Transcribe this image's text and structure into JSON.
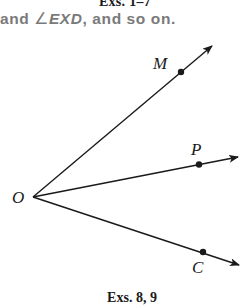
{
  "header": {
    "caption": "Exs. 1–7",
    "text_before": "and ",
    "angle_symbol": "∠",
    "angle_name": "EXD",
    "text_after": ", and so on."
  },
  "figure": {
    "vertex_label": "O",
    "rays": [
      {
        "point_label": "M",
        "direction": "upper-right"
      },
      {
        "point_label": "P",
        "direction": "right"
      },
      {
        "point_label": "C",
        "direction": "lower-right"
      }
    ]
  },
  "footer": {
    "caption": "Exs. 8, 9"
  }
}
